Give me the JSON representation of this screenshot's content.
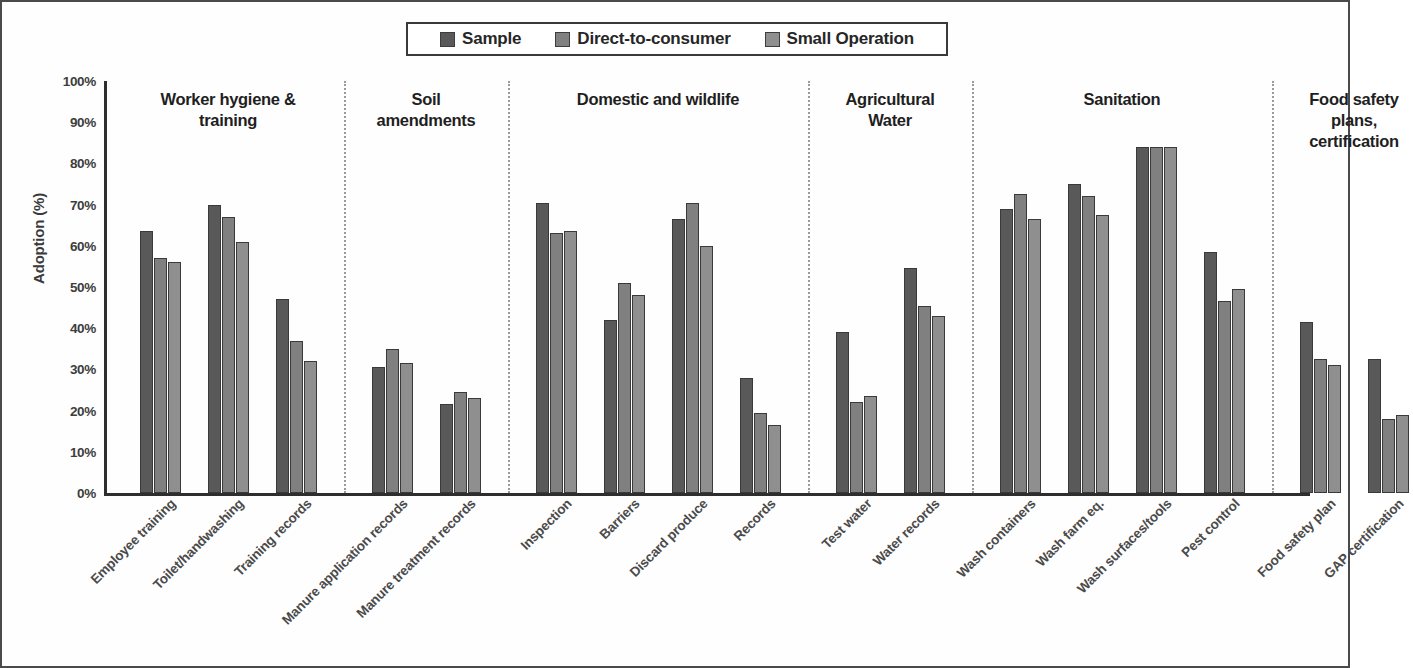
{
  "chart_data": {
    "type": "bar",
    "title": "",
    "xlabel": "",
    "ylabel": "Adoption (%)",
    "ylim": [
      0,
      100
    ],
    "ytick_labels": [
      "100%",
      "90%",
      "80%",
      "70%",
      "60%",
      "50%",
      "40%",
      "30%",
      "20%",
      "10%",
      "0%"
    ],
    "ytick_values": [
      100,
      90,
      80,
      70,
      60,
      50,
      40,
      30,
      20,
      10,
      0
    ],
    "grid": false,
    "legend_position": "top-center",
    "legend": [
      "Sample",
      "Direct-to-consumer",
      "Small Operation"
    ],
    "categories": [
      "Employee training",
      "Toilet/handwashing",
      "Training records",
      "Manure application records",
      "Manure treatment records",
      "Inspection",
      "Barriers",
      "Discard produce",
      "Records",
      "Test water",
      "Water records",
      "Wash containers",
      "Wash farm eq.",
      "Wash surfaces/tools",
      "Pest control",
      "Food safety plan",
      "GAP certification"
    ],
    "series": [
      {
        "name": "Sample",
        "color": "#595959",
        "values": [
          63.5,
          70,
          47,
          30.5,
          21.5,
          70.5,
          42,
          66.5,
          28,
          39,
          54.5,
          69,
          75,
          84,
          58.5,
          41.5,
          32.5
        ]
      },
      {
        "name": "Direct-to-consumer",
        "color": "#808080",
        "values": [
          57,
          67,
          37,
          35,
          24.5,
          63,
          51,
          70.5,
          19.5,
          22,
          45.5,
          72.5,
          72,
          84,
          46.5,
          32.5,
          18
        ]
      },
      {
        "name": "Small Operation",
        "color": "#8f8f8f",
        "values": [
          56,
          61,
          32,
          31.5,
          23,
          63.5,
          48,
          60,
          16.5,
          23.5,
          43,
          66.5,
          67.5,
          84,
          49.5,
          31,
          19
        ]
      }
    ],
    "groups": [
      {
        "title": "Worker hygiene & training",
        "title_lines": [
          "Worker hygiene &",
          "training"
        ],
        "categories": [
          "Employee training",
          "Toilet/handwashing",
          "Training records"
        ]
      },
      {
        "title": "Soil amendments",
        "title_lines": [
          "Soil",
          "amendments"
        ],
        "categories": [
          "Manure application records",
          "Manure treatment records"
        ]
      },
      {
        "title": "Domestic and wildlife",
        "title_lines": [
          "Domestic and wildlife"
        ],
        "categories": [
          "Inspection",
          "Barriers",
          "Discard produce",
          "Records"
        ]
      },
      {
        "title": "Agricultural Water",
        "title_lines": [
          "Agricultural",
          "Water"
        ],
        "categories": [
          "Test water",
          "Water records"
        ]
      },
      {
        "title": "Sanitation",
        "title_lines": [
          "Sanitation"
        ],
        "categories": [
          "Wash containers",
          "Wash farm eq.",
          "Wash surfaces/tools",
          "Pest control"
        ]
      },
      {
        "title": "Food safety plans, certification",
        "title_lines": [
          "Food safety",
          "plans,",
          "certification"
        ],
        "categories": [
          "Food safety plan",
          "GAP certification"
        ]
      }
    ]
  }
}
